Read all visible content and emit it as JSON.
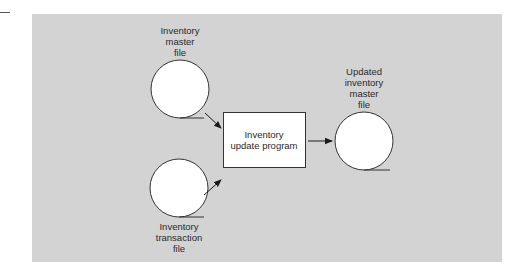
{
  "diagram": {
    "type": "system-flowchart",
    "background_color": "#d3d3d3",
    "nodes": {
      "master_file": {
        "shape": "magnetic-disk-file (circle with tangent line)",
        "label_lines": [
          "Inventory",
          "master",
          "file"
        ]
      },
      "transaction_file": {
        "shape": "magnetic-disk-file (circle with tangent line)",
        "label_lines": [
          "Inventory",
          "transaction",
          "file"
        ]
      },
      "update_program": {
        "shape": "process-box",
        "label_lines": [
          "Inventory",
          "update program"
        ]
      },
      "updated_master_file": {
        "shape": "magnetic-disk-file (circle with tangent line)",
        "label_lines": [
          "Updated",
          "inventory",
          "master",
          "file"
        ]
      }
    },
    "edges": [
      {
        "from": "Inventory master file",
        "to": "Inventory update program"
      },
      {
        "from": "Inventory transaction file",
        "to": "Inventory update program"
      },
      {
        "from": "Inventory update program",
        "to": "Updated inventory master file"
      }
    ]
  }
}
